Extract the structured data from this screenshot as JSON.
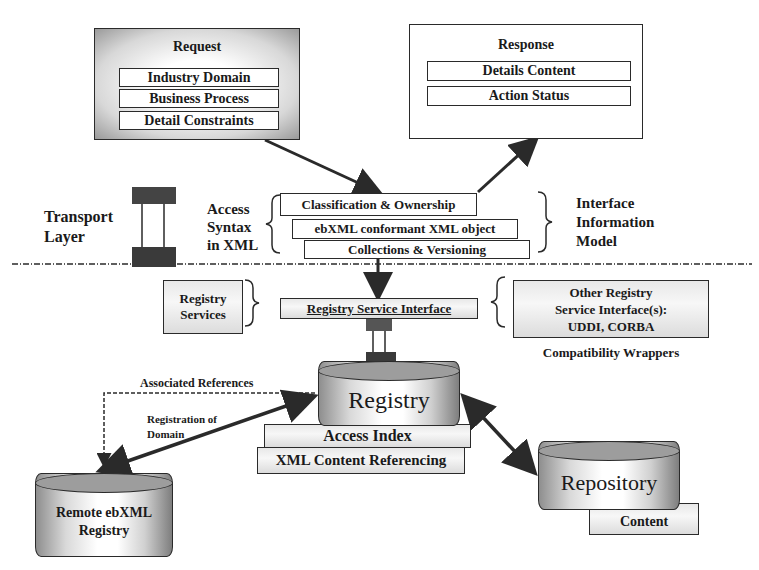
{
  "request": {
    "title": "Request",
    "items": [
      "Industry Domain",
      "Business Process",
      "Detail Constraints"
    ]
  },
  "response": {
    "title": "Response",
    "items": [
      "Details Content",
      "Action Status"
    ]
  },
  "transport": {
    "label_line1": "Transport",
    "label_line2": "Layer"
  },
  "access_syntax": {
    "line1": "Access",
    "line2": "Syntax",
    "line3": "in XML"
  },
  "interface_model": {
    "items": [
      "Classification & Ownership",
      "ebXML conformant XML object",
      "Collections & Versioning"
    ],
    "label_line1": "Interface",
    "label_line2": "Information",
    "label_line3": "Model"
  },
  "registry_services": {
    "label_line1": "Registry",
    "label_line2": "Services",
    "interface": "Registry Service Interface"
  },
  "other_registry": {
    "line1": "Other Registry",
    "line2": "Service Interface(s):",
    "line3": "UDDI, CORBA",
    "caption": "Compatibility Wrappers"
  },
  "registry": {
    "title": "Registry",
    "layers": [
      "Access Index",
      "XML Content Referencing"
    ]
  },
  "remote_registry": {
    "line1": "Remote ebXML",
    "line2": "Registry"
  },
  "repository": {
    "title": "Repository",
    "layer": "Content"
  },
  "connectors": {
    "associated_references": "Associated References",
    "registration_line1": "Registration of",
    "registration_line2": "Domain"
  },
  "colors": {
    "line": "#2a2a2a",
    "shade_dark": "#7e7e7e",
    "shade_light": "#ffffff"
  }
}
